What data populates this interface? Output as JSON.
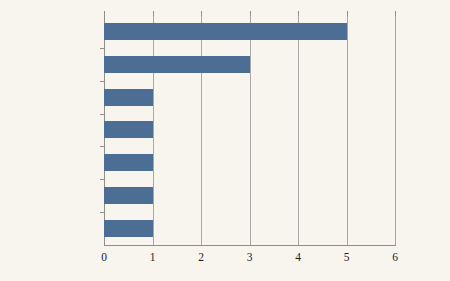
{
  "chart_data": {
    "type": "bar",
    "orientation": "horizontal",
    "title": "",
    "subtitle": "",
    "xlabel": "",
    "ylabel": "",
    "categories": [
      "买卖合同纠纷",
      "借款合同纠纷",
      "服务合同纠纷",
      "运输合同纠纷",
      "确认合同效力纠纷",
      "建设工程合同纠纷",
      "居间合同纠纷"
    ],
    "values": [
      5,
      3,
      1,
      1,
      1,
      1,
      1
    ],
    "xlim": [
      0,
      6
    ],
    "xticks": [
      "0",
      "1",
      "2",
      "3",
      "4",
      "5",
      "6"
    ],
    "xtick_values": [
      0,
      1,
      2,
      3,
      4,
      5,
      6
    ],
    "grid": true,
    "grid_axis": "x",
    "legend": false,
    "legend_position": "none",
    "colors": {
      "bar": "#4c6e94",
      "background": "#f7f5ee",
      "gridline": "#a8a8a2",
      "axis": "#8f8f88",
      "text": "#1d1d1d"
    }
  }
}
